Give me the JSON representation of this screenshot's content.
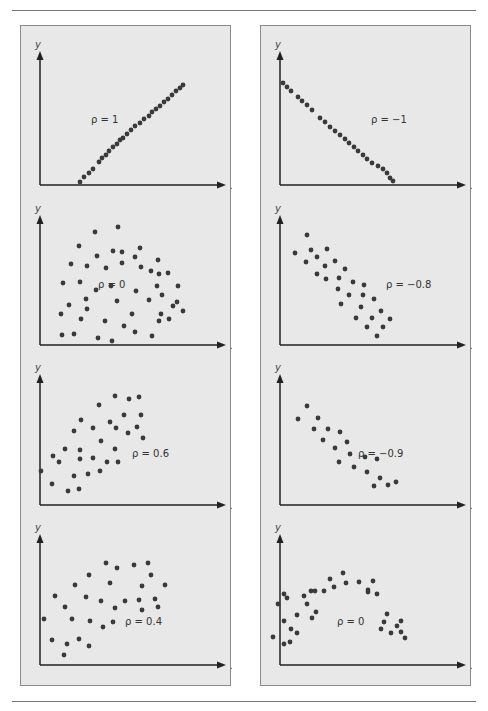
{
  "page": {
    "background": "#ffffff",
    "panel_bg": "#e8e8e8",
    "dot_color": "#3a3a3a",
    "axis_color": "#222222"
  },
  "chart_data": [
    {
      "type": "scatter",
      "panel": "left",
      "row": 0,
      "title": "",
      "annotation": "ρ = 1",
      "xlabel": "x",
      "ylabel": "y",
      "grid": false,
      "points": [
        [
          79,
          181
        ],
        [
          83,
          176
        ],
        [
          88,
          172
        ],
        [
          92,
          168
        ],
        [
          98,
          161
        ],
        [
          101,
          157
        ],
        [
          105,
          154
        ],
        [
          108,
          150
        ],
        [
          112,
          146
        ],
        [
          116,
          143
        ],
        [
          119,
          139
        ],
        [
          122,
          137
        ],
        [
          126,
          133
        ],
        [
          130,
          129
        ],
        [
          134,
          125
        ],
        [
          139,
          122
        ],
        [
          143,
          118
        ],
        [
          148,
          115
        ],
        [
          151,
          111
        ],
        [
          155,
          108
        ],
        [
          159,
          105
        ],
        [
          163,
          101
        ],
        [
          167,
          98
        ],
        [
          171,
          94
        ],
        [
          175,
          90
        ],
        [
          179,
          87
        ],
        [
          182,
          84
        ]
      ]
    },
    {
      "type": "scatter",
      "panel": "right",
      "row": 0,
      "title": "",
      "annotation": "ρ = −1",
      "xlabel": "x",
      "ylabel": "y",
      "grid": false,
      "points": [
        [
          282,
          82
        ],
        [
          286,
          86
        ],
        [
          290,
          90
        ],
        [
          297,
          96
        ],
        [
          301,
          100
        ],
        [
          306,
          104
        ],
        [
          311,
          109
        ],
        [
          319,
          117
        ],
        [
          324,
          121
        ],
        [
          329,
          126
        ],
        [
          334,
          130
        ],
        [
          339,
          134
        ],
        [
          344,
          138
        ],
        [
          348,
          142
        ],
        [
          353,
          146
        ],
        [
          357,
          150
        ],
        [
          362,
          154
        ],
        [
          366,
          158
        ],
        [
          371,
          162
        ],
        [
          377,
          165
        ],
        [
          382,
          168
        ],
        [
          386,
          172
        ],
        [
          389,
          177
        ],
        [
          392,
          180
        ]
      ]
    },
    {
      "type": "scatter",
      "panel": "left",
      "row": 1,
      "title": "",
      "annotation": "ρ = 0",
      "xlabel": "x",
      "ylabel": "y",
      "grid": false,
      "points": [
        [
          117,
          226
        ],
        [
          94,
          231
        ],
        [
          78,
          245
        ],
        [
          112,
          250
        ],
        [
          139,
          247
        ],
        [
          96,
          255
        ],
        [
          121,
          251
        ],
        [
          134,
          256
        ],
        [
          70,
          263
        ],
        [
          86,
          265
        ],
        [
          121,
          262
        ],
        [
          105,
          267
        ],
        [
          140,
          266
        ],
        [
          157,
          259
        ],
        [
          62,
          282
        ],
        [
          79,
          281
        ],
        [
          95,
          289
        ],
        [
          85,
          298
        ],
        [
          110,
          285
        ],
        [
          135,
          290
        ],
        [
          158,
          273
        ],
        [
          150,
          270
        ],
        [
          167,
          272
        ],
        [
          156,
          285
        ],
        [
          148,
          299
        ],
        [
          161,
          294
        ],
        [
          177,
          285
        ],
        [
          68,
          304
        ],
        [
          86,
          308
        ],
        [
          116,
          300
        ],
        [
          131,
          313
        ],
        [
          160,
          313
        ],
        [
          172,
          305
        ],
        [
          80,
          318
        ],
        [
          104,
          320
        ],
        [
          123,
          325
        ],
        [
          151,
          335
        ],
        [
          61,
          334
        ],
        [
          73,
          333
        ],
        [
          97,
          337
        ],
        [
          111,
          340
        ],
        [
          134,
          331
        ],
        [
          158,
          320
        ],
        [
          182,
          310
        ],
        [
          168,
          318
        ],
        [
          176,
          301
        ],
        [
          60,
          313
        ]
      ]
    },
    {
      "type": "scatter",
      "panel": "right",
      "row": 1,
      "title": "",
      "annotation": "ρ = −0.8",
      "xlabel": "x",
      "ylabel": "y",
      "grid": false,
      "points": [
        [
          306,
          234
        ],
        [
          294,
          252
        ],
        [
          310,
          249
        ],
        [
          326,
          248
        ],
        [
          305,
          261
        ],
        [
          316,
          256
        ],
        [
          324,
          265
        ],
        [
          334,
          260
        ],
        [
          316,
          273
        ],
        [
          325,
          278
        ],
        [
          338,
          277
        ],
        [
          344,
          268
        ],
        [
          337,
          288
        ],
        [
          352,
          281
        ],
        [
          363,
          284
        ],
        [
          348,
          294
        ],
        [
          362,
          294
        ],
        [
          373,
          298
        ],
        [
          340,
          303
        ],
        [
          360,
          306
        ],
        [
          380,
          310
        ],
        [
          355,
          317
        ],
        [
          371,
          317
        ],
        [
          389,
          318
        ],
        [
          366,
          326
        ],
        [
          382,
          326
        ],
        [
          376,
          335
        ]
      ]
    },
    {
      "type": "scatter",
      "panel": "left",
      "row": 2,
      "title": "",
      "annotation": "ρ = 0.6",
      "xlabel": "x",
      "ylabel": "y",
      "grid": false,
      "points": [
        [
          114,
          395
        ],
        [
          128,
          398
        ],
        [
          138,
          396
        ],
        [
          98,
          404
        ],
        [
          123,
          414
        ],
        [
          140,
          414
        ],
        [
          80,
          419
        ],
        [
          109,
          421
        ],
        [
          92,
          427
        ],
        [
          136,
          426
        ],
        [
          73,
          430
        ],
        [
          115,
          427
        ],
        [
          127,
          432
        ],
        [
          142,
          437
        ],
        [
          100,
          440
        ],
        [
          64,
          448
        ],
        [
          79,
          449
        ],
        [
          114,
          448
        ],
        [
          52,
          455
        ],
        [
          58,
          461
        ],
        [
          92,
          457
        ],
        [
          79,
          458
        ],
        [
          106,
          461
        ],
        [
          117,
          461
        ],
        [
          40,
          470
        ],
        [
          73,
          475
        ],
        [
          87,
          473
        ],
        [
          99,
          470
        ],
        [
          51,
          483
        ],
        [
          67,
          490
        ],
        [
          78,
          488
        ]
      ]
    },
    {
      "type": "scatter",
      "panel": "right",
      "row": 2,
      "title": "",
      "annotation": "ρ = −0.9",
      "xlabel": "x",
      "ylabel": "y",
      "grid": false,
      "points": [
        [
          306,
          405
        ],
        [
          297,
          418
        ],
        [
          317,
          417
        ],
        [
          313,
          428
        ],
        [
          327,
          428
        ],
        [
          339,
          431
        ],
        [
          322,
          439
        ],
        [
          346,
          441
        ],
        [
          334,
          447
        ],
        [
          349,
          453
        ],
        [
          364,
          456
        ],
        [
          376,
          458
        ],
        [
          338,
          461
        ],
        [
          353,
          466
        ],
        [
          366,
          471
        ],
        [
          379,
          477
        ],
        [
          373,
          485
        ],
        [
          387,
          484
        ],
        [
          395,
          481
        ]
      ]
    },
    {
      "type": "scatter",
      "panel": "left",
      "row": 3,
      "title": "",
      "annotation": "ρ = 0.4",
      "xlabel": "x",
      "ylabel": "y",
      "grid": false,
      "points": [
        [
          105,
          562
        ],
        [
          116,
          567
        ],
        [
          133,
          564
        ],
        [
          147,
          562
        ],
        [
          88,
          574
        ],
        [
          150,
          574
        ],
        [
          109,
          582
        ],
        [
          74,
          584
        ],
        [
          141,
          585
        ],
        [
          164,
          584
        ],
        [
          154,
          598
        ],
        [
          54,
          595
        ],
        [
          85,
          596
        ],
        [
          100,
          600
        ],
        [
          124,
          600
        ],
        [
          138,
          599
        ],
        [
          157,
          606
        ],
        [
          64,
          606
        ],
        [
          114,
          607
        ],
        [
          141,
          609
        ],
        [
          43,
          618
        ],
        [
          71,
          618
        ],
        [
          89,
          620
        ],
        [
          112,
          621
        ],
        [
          102,
          626
        ],
        [
          51,
          639
        ],
        [
          66,
          643
        ],
        [
          78,
          638
        ],
        [
          88,
          645
        ],
        [
          63,
          654
        ]
      ]
    },
    {
      "type": "scatter",
      "panel": "right",
      "row": 3,
      "title": "",
      "annotation": "ρ = 0",
      "xlabel": "x",
      "ylabel": "y",
      "grid": false,
      "points": [
        [
          342,
          572
        ],
        [
          329,
          578
        ],
        [
          345,
          582
        ],
        [
          358,
          581
        ],
        [
          372,
          580
        ],
        [
          333,
          586
        ],
        [
          367,
          589
        ],
        [
          314,
          590
        ],
        [
          323,
          590
        ],
        [
          283,
          593
        ],
        [
          367,
          591
        ],
        [
          376,
          593
        ],
        [
          303,
          595
        ],
        [
          310,
          590
        ],
        [
          286,
          597
        ],
        [
          277,
          603
        ],
        [
          306,
          603
        ],
        [
          315,
          611
        ],
        [
          296,
          614
        ],
        [
          386,
          613
        ],
        [
          311,
          617
        ],
        [
          283,
          620
        ],
        [
          290,
          628
        ],
        [
          383,
          621
        ],
        [
          396,
          625
        ],
        [
          400,
          620
        ],
        [
          272,
          636
        ],
        [
          283,
          643
        ],
        [
          296,
          632
        ],
        [
          380,
          628
        ],
        [
          400,
          631
        ],
        [
          404,
          637
        ],
        [
          390,
          632
        ],
        [
          289,
          641
        ]
      ]
    }
  ]
}
